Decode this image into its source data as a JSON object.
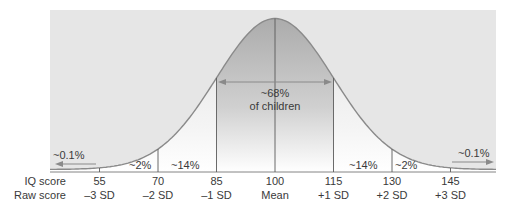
{
  "chart_data": {
    "type": "area",
    "title": "",
    "xlabel": "",
    "ylabel": "",
    "mean": 100,
    "sd": 15,
    "x_range": [
      45,
      160
    ],
    "row_labels": {
      "iq": "IQ score",
      "raw": "Raw score"
    },
    "ticks": [
      {
        "iq": "55",
        "raw": "–3 SD",
        "value": 55
      },
      {
        "iq": "70",
        "raw": "–2 SD",
        "value": 70
      },
      {
        "iq": "85",
        "raw": "–1 SD",
        "value": 85
      },
      {
        "iq": "100",
        "raw": "Mean",
        "value": 100
      },
      {
        "iq": "115",
        "raw": "+1 SD",
        "value": 115
      },
      {
        "iq": "130",
        "raw": "+2 SD",
        "value": 130
      },
      {
        "iq": "145",
        "raw": "+3 SD",
        "value": 145
      }
    ],
    "regions": [
      {
        "range": "<55",
        "label": "~0.1%",
        "percent": 0.1
      },
      {
        "range": "55-70",
        "label": "~2%",
        "percent": 2
      },
      {
        "range": "70-85",
        "label": "~14%",
        "percent": 14
      },
      {
        "range": "85-115",
        "label": "~68%",
        "sublabel": "of children",
        "percent": 68
      },
      {
        "range": "115-130",
        "label": "~14%",
        "percent": 14
      },
      {
        "range": "130-145",
        "label": "~2%",
        "percent": 2
      },
      {
        "range": ">145",
        "label": "~0.1%",
        "percent": 0.1
      }
    ],
    "annotations": {
      "center_pct": "~68%",
      "center_sub": "of children",
      "left_tail": "~0.1%",
      "right_tail": "~0.1%",
      "left_2": "~2%",
      "left_14": "~14%",
      "right_14": "~14%",
      "right_2": "~2%"
    },
    "colors": {
      "background": "#e6e6e6",
      "center_fill": "#b8b8b8",
      "curve": "#8a8a8a",
      "lines": "#5a5a5a",
      "arrow": "#8a8a8a"
    },
    "grid": false,
    "legend": "none"
  }
}
